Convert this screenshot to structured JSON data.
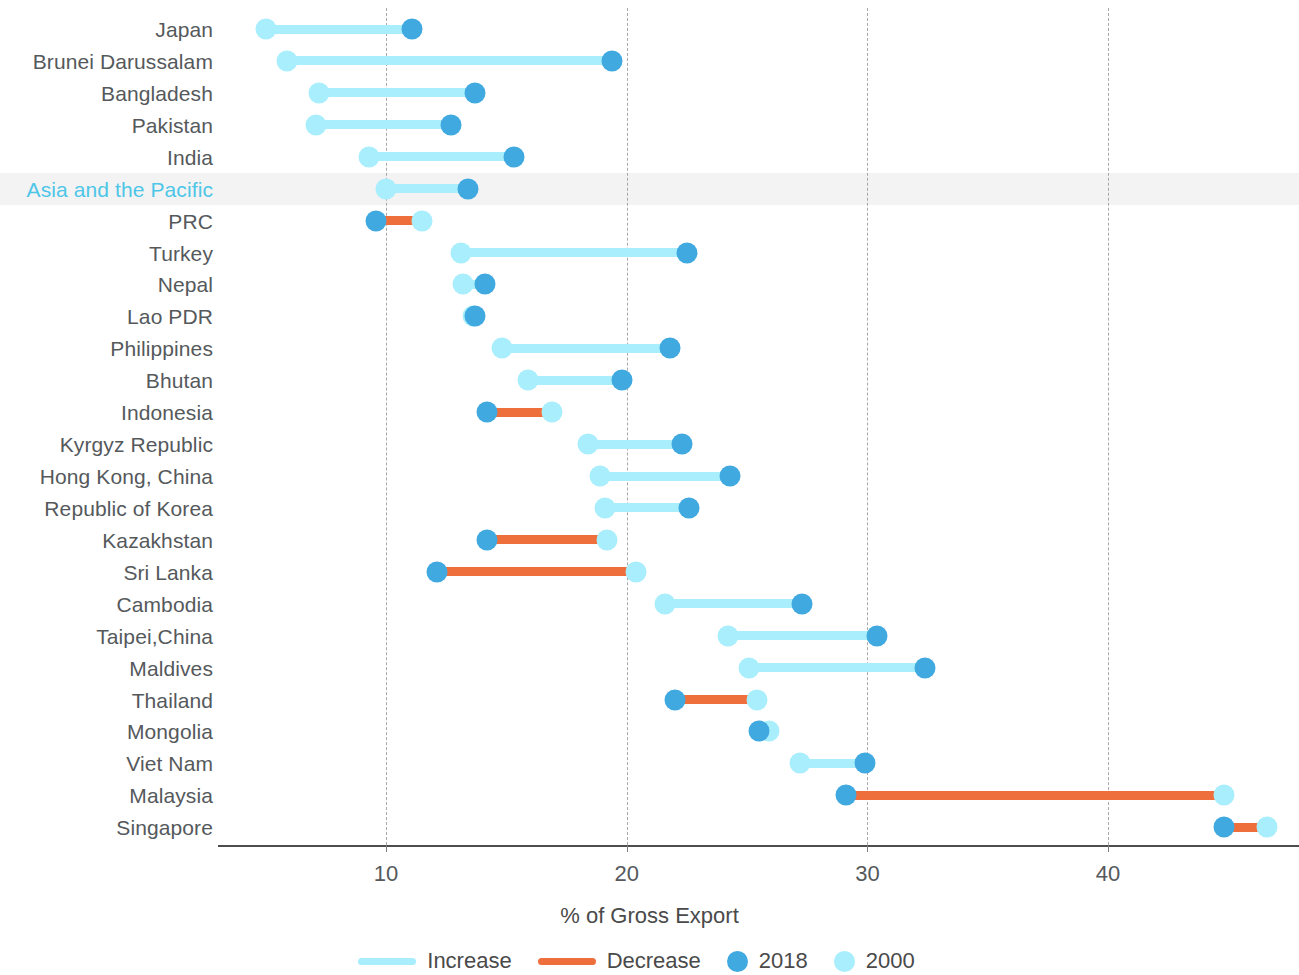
{
  "chart_data": {
    "type": "scatter",
    "subtype": "dumbbell",
    "title": "",
    "xlabel": "% of Gross Export",
    "ylabel": "",
    "xlim": [
      4,
      48
    ],
    "xticks": [
      10,
      20,
      30,
      40
    ],
    "xtick_labels": [
      "10",
      "20",
      "30",
      "40"
    ],
    "grid": true,
    "legend_position": "bottom",
    "series": [
      {
        "name": "2018",
        "color": "#3fa9e0"
      },
      {
        "name": "2000",
        "color": "#a8eefc"
      }
    ],
    "connector_types": [
      {
        "name": "Increase",
        "color": "#a8eefc"
      },
      {
        "name": "Decrease",
        "color": "#ef6f3c"
      }
    ],
    "categories": [
      "Japan",
      "Brunei Darussalam",
      "Bangladesh",
      "Pakistan",
      "India",
      "Asia and the Pacific",
      "PRC",
      "Turkey",
      "Nepal",
      "Lao PDR",
      "Philippines",
      "Bhutan",
      "Indonesia",
      "Kyrgyz Republic",
      "Hong Kong, China",
      "Republic of Korea",
      "Kazakhstan",
      "Sri Lanka",
      "Cambodia",
      "Taipei,China",
      "Maldives",
      "Thailand",
      "Mongolia",
      "Viet Nam",
      "Malaysia",
      "Singapore"
    ],
    "rows": [
      {
        "label": "Japan",
        "v2000": 5.0,
        "v2018": 11.1,
        "change": "Increase",
        "highlight": false
      },
      {
        "label": "Brunei Darussalam",
        "v2000": 5.9,
        "v2018": 19.4,
        "change": "Increase",
        "highlight": false
      },
      {
        "label": "Bangladesh",
        "v2000": 7.2,
        "v2018": 13.7,
        "change": "Increase",
        "highlight": false
      },
      {
        "label": "Pakistan",
        "v2000": 7.1,
        "v2018": 12.7,
        "change": "Increase",
        "highlight": false
      },
      {
        "label": "India",
        "v2000": 9.3,
        "v2018": 15.3,
        "change": "Increase",
        "highlight": false
      },
      {
        "label": "Asia and the Pacific",
        "v2000": 10.0,
        "v2018": 13.4,
        "change": "Increase",
        "highlight": true
      },
      {
        "label": "PRC",
        "v2000": 11.5,
        "v2018": 9.6,
        "change": "Decrease",
        "highlight": false
      },
      {
        "label": "Turkey",
        "v2000": 13.1,
        "v2018": 22.5,
        "change": "Increase",
        "highlight": false
      },
      {
        "label": "Nepal",
        "v2000": 13.2,
        "v2018": 14.1,
        "change": "Increase",
        "highlight": false
      },
      {
        "label": "Lao PDR",
        "v2000": 13.6,
        "v2018": 13.7,
        "change": "Increase",
        "highlight": false
      },
      {
        "label": "Philippines",
        "v2000": 14.8,
        "v2018": 21.8,
        "change": "Increase",
        "highlight": false
      },
      {
        "label": "Bhutan",
        "v2000": 15.9,
        "v2018": 19.8,
        "change": "Increase",
        "highlight": false
      },
      {
        "label": "Indonesia",
        "v2000": 16.9,
        "v2018": 14.2,
        "change": "Decrease",
        "highlight": false
      },
      {
        "label": "Kyrgyz Republic",
        "v2000": 18.4,
        "v2018": 22.3,
        "change": "Increase",
        "highlight": false
      },
      {
        "label": "Hong Kong, China",
        "v2000": 18.9,
        "v2018": 24.3,
        "change": "Increase",
        "highlight": false
      },
      {
        "label": "Republic of Korea",
        "v2000": 19.1,
        "v2018": 22.6,
        "change": "Increase",
        "highlight": false
      },
      {
        "label": "Kazakhstan",
        "v2000": 19.2,
        "v2018": 14.2,
        "change": "Decrease",
        "highlight": false
      },
      {
        "label": "Sri Lanka",
        "v2000": 20.4,
        "v2018": 12.1,
        "change": "Decrease",
        "highlight": false
      },
      {
        "label": "Cambodia",
        "v2000": 21.6,
        "v2018": 27.3,
        "change": "Increase",
        "highlight": false
      },
      {
        "label": "Taipei,China",
        "v2000": 24.2,
        "v2018": 30.4,
        "change": "Increase",
        "highlight": false
      },
      {
        "label": "Maldives",
        "v2000": 25.1,
        "v2018": 32.4,
        "change": "Increase",
        "highlight": false
      },
      {
        "label": "Thailand",
        "v2000": 25.4,
        "v2018": 22.0,
        "change": "Decrease",
        "highlight": false
      },
      {
        "label": "Mongolia",
        "v2000": 25.9,
        "v2018": 25.5,
        "change": "Decrease",
        "highlight": false
      },
      {
        "label": "Viet Nam",
        "v2000": 27.2,
        "v2018": 29.9,
        "change": "Increase",
        "highlight": false
      },
      {
        "label": "Malaysia",
        "v2000": 44.8,
        "v2018": 29.1,
        "change": "Decrease",
        "highlight": false
      },
      {
        "label": "Singapore",
        "v2000": 46.6,
        "v2018": 44.8,
        "change": "Decrease",
        "highlight": false
      }
    ]
  },
  "axis": {
    "x_title": "% of Gross Export",
    "ticks": [
      "10",
      "20",
      "30",
      "40"
    ]
  },
  "legend": {
    "items": [
      {
        "label": "Increase",
        "kind": "line",
        "color": "#a8eefc"
      },
      {
        "label": "Decrease",
        "kind": "line",
        "color": "#ef6f3c"
      },
      {
        "label": "2018",
        "kind": "dot",
        "color": "#3fa9e0"
      },
      {
        "label": "2000",
        "kind": "dot",
        "color": "#a8eefc"
      }
    ]
  },
  "colors": {
    "increase": "#a8eefc",
    "decrease": "#ef6f3c",
    "dot_2018": "#3fa9e0",
    "dot_2000": "#a8eefc",
    "highlight_label": "#4ec6e8",
    "label_text": "#55595c",
    "axis": "#4d4d4d",
    "gridline": "#9a9a9a",
    "highlight_band": "#f1f1f1"
  }
}
